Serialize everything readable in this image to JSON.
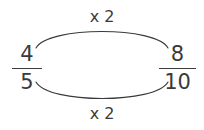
{
  "diagram": {
    "stroke_color": "#3a3a3a",
    "background_color": "#ffffff",
    "left_fraction": {
      "numerator": "4",
      "denominator": "5",
      "label": "4/5"
    },
    "right_fraction": {
      "numerator": "8",
      "denominator": "10",
      "label": "8/10"
    },
    "top_arrow": {
      "label": "x 2",
      "relation": "numerator-to-numerator"
    },
    "bottom_arrow": {
      "label": "x 2",
      "relation": "denominator-to-denominator"
    }
  }
}
